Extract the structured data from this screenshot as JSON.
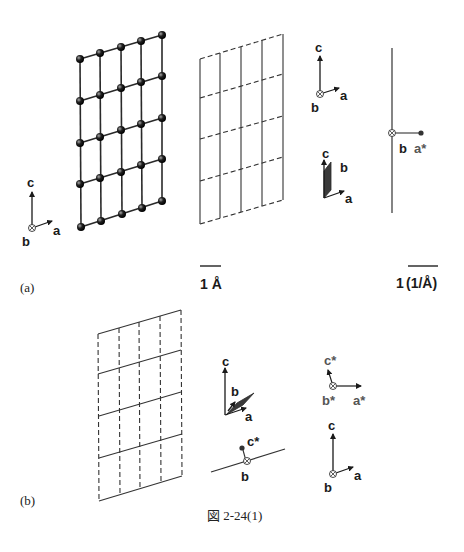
{
  "figure": {
    "caption": "図 2-24(1)",
    "panel_a": {
      "label": "(a)",
      "real_lattice": {
        "description": "5 x 5 atom lattice in ac-plane (perspective)",
        "columns": 5,
        "rows": 5
      },
      "transform_grid": {
        "description": "dashed rows, solid columns",
        "columns": 5,
        "rows": 5
      },
      "axes_left": {
        "c": "c",
        "a": "a",
        "b": "b"
      },
      "axes_right_top": {
        "c": "c",
        "a": "a",
        "b": "b"
      },
      "axes_right_plane": {
        "c": "c",
        "a": "a",
        "b": "b"
      },
      "reciprocal_line": {
        "b": "b",
        "a_star": "a*"
      },
      "scale_real": "1 Å",
      "scale_reciprocal_num": "1",
      "scale_reciprocal_unit": "(1/Å)"
    },
    "panel_b": {
      "label": "(b)",
      "grid": {
        "description": "solid rows, dashed columns",
        "columns": 5,
        "rows": 5
      },
      "axes_plane": {
        "c": "c",
        "a": "a",
        "b": "b"
      },
      "reciprocal_line": {
        "c_star": "c*",
        "b": "b"
      },
      "axes_star": {
        "c_star": "c*",
        "b_star": "b*",
        "a_star": "a*"
      },
      "axes_real": {
        "c": "c",
        "a": "a",
        "b": "b"
      }
    }
  },
  "colors": {
    "line": "#2a2a2a",
    "atom": "#1c1c1c",
    "plane": "#3a3a3a",
    "star_label": "#555555"
  }
}
